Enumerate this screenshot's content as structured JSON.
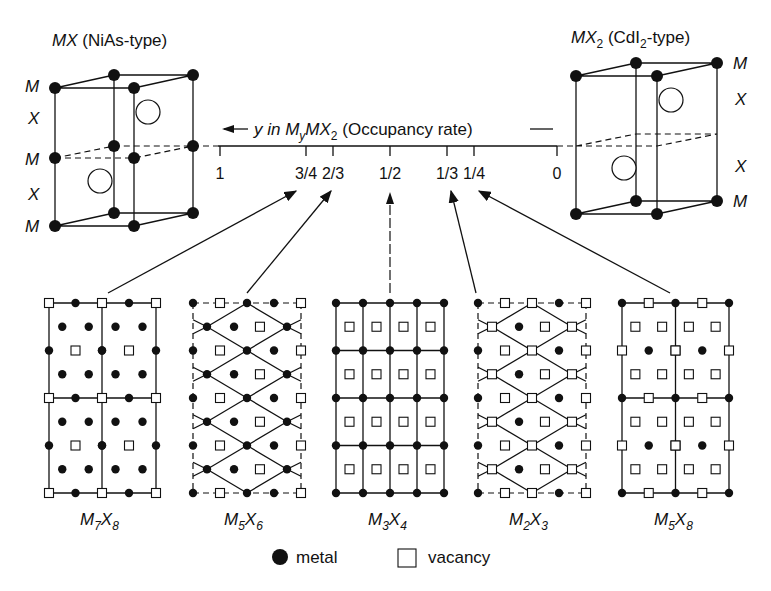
{
  "left_structure": {
    "title_italic": "MX",
    "title_rest": " (NiAs-type)",
    "layer_labels": [
      "M",
      "X",
      "M",
      "X",
      "M"
    ]
  },
  "right_structure": {
    "title_italic": "MX",
    "title_sub": "2",
    "title_rest": " (CdI",
    "title_sub2": "2",
    "title_end": "-type)",
    "layer_labels": [
      "M",
      "X",
      "X",
      "M"
    ]
  },
  "axis": {
    "label_prefix": "y in ",
    "label_formula_m": "M",
    "label_formula_sub": "y",
    "label_formula_mx": "MX",
    "label_formula_sub2": "2",
    "label_suffix": " (Occupancy rate)",
    "ticks": [
      {
        "label": "1",
        "x": 220
      },
      {
        "label": "3/4",
        "x": 306
      },
      {
        "label": "2/3",
        "x": 333
      },
      {
        "label": "1/2",
        "x": 390
      },
      {
        "label": "1/3",
        "x": 447
      },
      {
        "label": "1/4",
        "x": 474
      },
      {
        "label": "0",
        "x": 557
      }
    ]
  },
  "phases": [
    {
      "m": "M",
      "m_sub": "7",
      "x": "X",
      "x_sub": "8",
      "y": "3/4"
    },
    {
      "m": "M",
      "m_sub": "5",
      "x": "X",
      "x_sub": "6",
      "y": "2/3"
    },
    {
      "m": "M",
      "m_sub": "3",
      "x": "X",
      "x_sub": "4",
      "y": "1/2"
    },
    {
      "m": "M",
      "m_sub": "2",
      "x": "X",
      "x_sub": "3",
      "y": "1/3"
    },
    {
      "m": "M",
      "m_sub": "5",
      "x": "X",
      "x_sub": "8",
      "y": "1/4"
    }
  ],
  "legend": {
    "metal_label": "metal",
    "vacancy_label": "vacancy"
  }
}
